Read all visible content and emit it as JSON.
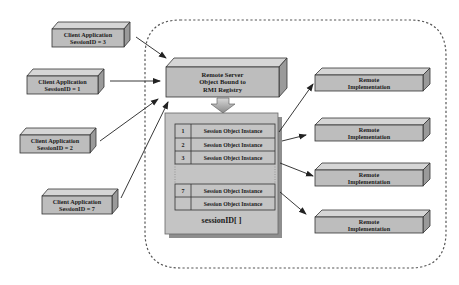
{
  "diagram": {
    "clients": [
      {
        "line1": "Client Application",
        "line2": "SessionID = 3"
      },
      {
        "line1": "Client Application",
        "line2": "SessionID = 1"
      },
      {
        "line1": "Client Application",
        "line2": "SessionID = 2"
      },
      {
        "line1": "Client Application",
        "line2": "SessionID = 7"
      }
    ],
    "server": {
      "line1": "Remote Server",
      "line2": "Object Bound to",
      "line3": "RMI Registry"
    },
    "session_table": {
      "title": "sessionID[ ]",
      "rows": [
        {
          "index": "1",
          "label": "Session Object Instance"
        },
        {
          "index": "2",
          "label": "Session Object Instance"
        },
        {
          "index": "3",
          "label": "Session Object Instance"
        },
        {
          "index": "7",
          "label": "Session Object Instance"
        },
        {
          "index": "",
          "label": "Session Object Instance"
        }
      ]
    },
    "implementations": [
      {
        "line1": "Remote",
        "line2": "Implementation"
      },
      {
        "line1": "Remote",
        "line2": "Implementation"
      },
      {
        "line1": "Remote",
        "line2": "Implementation"
      },
      {
        "line1": "Remote",
        "line2": "Implementation"
      }
    ],
    "colors": {
      "box_fill": "#bdbdbd",
      "box_top": "#d6d6d6",
      "box_side": "#9a9a9a",
      "outline": "#333333",
      "container_dash": "#555555"
    }
  }
}
